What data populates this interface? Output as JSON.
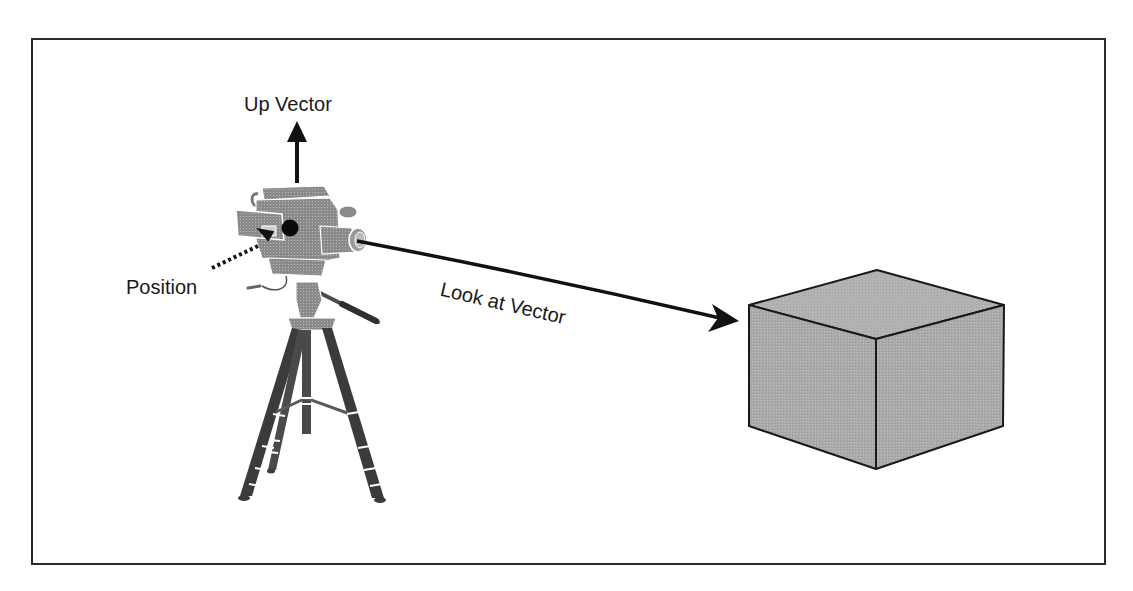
{
  "diagram": {
    "labels": {
      "up_vector": "Up Vector",
      "position": "Position",
      "look_at_vector": "Look at Vector"
    },
    "elements": {
      "camera": "video camera on tripod",
      "position_marker": "black dot on camera body",
      "up_arrow": "solid arrow pointing up from camera",
      "position_arrow": "dotted arrow pointing to camera position dot",
      "look_at_arrow": "solid arrow from lens to cube",
      "target": "shaded gray cube"
    },
    "colors": {
      "stroke": "#1a1a1a",
      "frame": "#2a2a2a",
      "cube_fill": "#a9a9a9",
      "cube_top_fill": "#b5b5b5",
      "camera_fill": "#8c8c8c",
      "background": "#ffffff"
    }
  }
}
